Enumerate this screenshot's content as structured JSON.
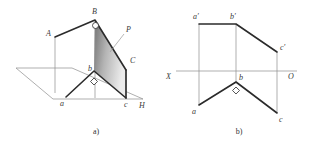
{
  "document": {
    "type": "descriptive-geometry-figure",
    "description": "Two-part engineering drawing: pictorial view of plane P with a right angle, and its two-view orthographic projection."
  },
  "figures": [
    {
      "id": "figure-a",
      "caption": "a)",
      "kind": "pictorial-axonometric",
      "labels": [
        {
          "name": "A",
          "text": "A",
          "x": 46,
          "y": 33,
          "style": "italic"
        },
        {
          "name": "B",
          "text": "B",
          "x": 92,
          "y": 13,
          "style": "italic"
        },
        {
          "name": "P",
          "text": "P",
          "x": 126,
          "y": 30,
          "style": "italic"
        },
        {
          "name": "C",
          "text": "C",
          "x": 128,
          "y": 61,
          "style": "italic"
        },
        {
          "name": "a",
          "text": "a",
          "x": 60,
          "y": 102,
          "style": "italic"
        },
        {
          "name": "b",
          "text": "b",
          "x": 89,
          "y": 71,
          "style": "italic"
        },
        {
          "name": "c",
          "text": "c",
          "x": 125,
          "y": 104,
          "style": "italic"
        },
        {
          "name": "H",
          "text": "H",
          "x": 141,
          "y": 106,
          "style": "italic"
        }
      ],
      "points": {
        "A": [
          55,
          37
        ],
        "B": [
          95,
          20
        ],
        "C": [
          126,
          70
        ],
        "a": [
          66,
          97
        ],
        "b": [
          94,
          71
        ],
        "c": [
          126,
          98
        ]
      },
      "plane_name": "P",
      "ground_plane_name": "H",
      "right_angles": [
        "at B (between AB and B-b)",
        "at b (between ab and bc)"
      ],
      "shading": {
        "fill_dark": "#7d7d7d",
        "fill_light": "#e3e3e3"
      }
    },
    {
      "id": "figure-b",
      "caption": "b)",
      "kind": "orthographic-two-view",
      "axis": {
        "name": "X-O axis",
        "left_label": "X",
        "right_label": "O",
        "y": 71
      },
      "labels": [
        {
          "name": "a-prime",
          "text": "a′",
          "x": 193,
          "y": 17,
          "style": "italic"
        },
        {
          "name": "b-prime",
          "text": "b′",
          "x": 229,
          "y": 17,
          "style": "italic"
        },
        {
          "name": "c-prime",
          "text": "c′",
          "x": 281,
          "y": 47,
          "style": "italic"
        },
        {
          "name": "X",
          "text": "X",
          "x": 169,
          "y": 77,
          "style": "italic"
        },
        {
          "name": "O",
          "text": "O",
          "x": 290,
          "y": 77,
          "style": "italic"
        },
        {
          "name": "b",
          "text": "b",
          "x": 239,
          "y": 79,
          "style": "italic"
        },
        {
          "name": "a",
          "text": "a",
          "x": 194,
          "y": 112,
          "style": "italic"
        },
        {
          "name": "c",
          "text": "c",
          "x": 281,
          "y": 120,
          "style": "italic"
        }
      ],
      "points": {
        "a_prime": [
          199,
          24
        ],
        "b_prime": [
          236,
          24
        ],
        "c_prime": [
          277,
          52
        ],
        "a": [
          199,
          105
        ],
        "b": [
          236,
          82
        ],
        "c": [
          277,
          113
        ]
      },
      "projection_lines": [
        {
          "name": "projector-a",
          "x": 199,
          "y1": 24,
          "y2": 105
        },
        {
          "name": "projector-b",
          "x": 236,
          "y1": 24,
          "y2": 82
        },
        {
          "name": "projector-c",
          "x": 277,
          "y1": 52,
          "y2": 113
        }
      ],
      "right_angles": [
        "at b (between ab and bc)"
      ]
    }
  ],
  "captions": {
    "a": "a)",
    "b": "b)"
  },
  "colors": {
    "line_thick": "#2b2b2b",
    "line_thin": "#8d8d8d",
    "text": "#3a3a3a",
    "background": "#ffffff",
    "shade_dark": "#7d7d7d",
    "shade_light": "#e6e6e6"
  }
}
